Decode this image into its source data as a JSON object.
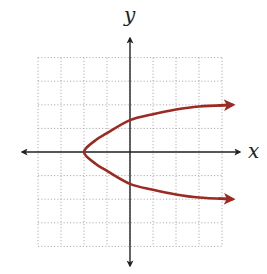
{
  "chart_data": {
    "type": "line",
    "title": "",
    "xlabel": "x",
    "ylabel": "y",
    "xlim": [
      -4,
      4
    ],
    "ylim": [
      -4,
      4
    ],
    "grid": true,
    "grid_style": "dotted",
    "legend": null,
    "tick_labels": false,
    "series": [
      {
        "name": "parabola opening right",
        "equation": "x = y^2 - 2",
        "color": "#9b2a22",
        "vertex": [
          -2,
          0
        ],
        "points": [
          [
            4.4,
            2.0
          ],
          [
            3.0,
            1.93
          ],
          [
            2.0,
            1.8
          ],
          [
            1.0,
            1.6
          ],
          [
            0.0,
            1.35
          ],
          [
            -1.0,
            0.8
          ],
          [
            -1.5,
            0.5
          ],
          [
            -2.0,
            0.0
          ],
          [
            -1.5,
            -0.5
          ],
          [
            -1.0,
            -0.8
          ],
          [
            0.0,
            -1.35
          ],
          [
            1.0,
            -1.6
          ],
          [
            2.0,
            -1.8
          ],
          [
            3.0,
            -1.93
          ],
          [
            4.4,
            -2.0
          ]
        ],
        "arrows": "both ends (pointing right)"
      }
    ]
  },
  "colors": {
    "curve": "#9b2a22",
    "axis": "#222222",
    "grid": "#9a9a9a",
    "background": "#ffffff"
  },
  "labels": {
    "x_axis": "x",
    "y_axis": "y"
  }
}
